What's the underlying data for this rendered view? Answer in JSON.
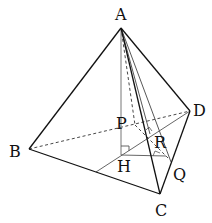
{
  "figure": {
    "labels": {
      "A": "A",
      "B": "B",
      "C": "C",
      "D": "D",
      "P": "P",
      "H": "H",
      "R": "R",
      "Q": "Q"
    },
    "points": {
      "A": [
        121,
        28
      ],
      "B": [
        29,
        149
      ],
      "C": [
        160,
        194
      ],
      "D": [
        190,
        111
      ],
      "H": [
        121,
        155
      ],
      "P": [
        135,
        125
      ],
      "R": [
        150,
        134
      ],
      "Q": [
        171,
        162
      ],
      "M": [
        96,
        172
      ]
    },
    "edges_solid": [
      "AB",
      "AC",
      "AD",
      "BC",
      "CD"
    ],
    "edges_dashed": [
      "BD",
      "AP",
      "PQ"
    ],
    "auxiliary_lines": [
      "AH",
      "AQ",
      "MD",
      "HQ"
    ],
    "right_angles": [
      "H",
      "R",
      "Q-foot"
    ]
  }
}
